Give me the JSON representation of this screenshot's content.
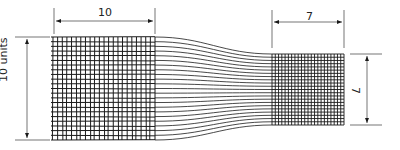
{
  "diagram": {
    "left_block": {
      "width_label": "10",
      "height_label": "10 units",
      "grid_cols": 22,
      "grid_rows": 22
    },
    "right_block": {
      "width_label": "7",
      "height_label": "7",
      "grid_cols": 22,
      "grid_rows": 22
    },
    "transition_lines": 22,
    "line_color": "#1a1a1a"
  }
}
